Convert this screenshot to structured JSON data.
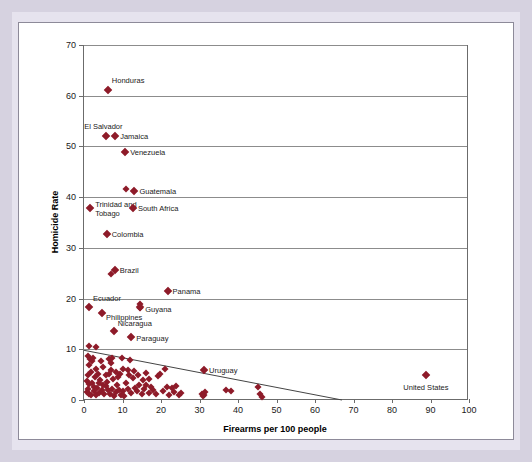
{
  "figure": {
    "background_color": "#d6d2e0",
    "card_color": "#ffffff",
    "marker_color": "#8e1b29"
  },
  "chart_data": {
    "type": "scatter",
    "title": "",
    "subtitle": "",
    "xlabel": "Firearms per 100 people",
    "ylabel": "Homicide Rate",
    "xlim": [
      0,
      100
    ],
    "ylim": [
      0,
      70
    ],
    "xticks": [
      0,
      10,
      20,
      30,
      40,
      50,
      60,
      70,
      80,
      90,
      100
    ],
    "yticks": [
      0,
      10,
      20,
      30,
      40,
      50,
      60,
      70
    ],
    "grid": "horizontal",
    "legend": "none",
    "marker": "diamond",
    "marker_color": "#8e1b29",
    "trendline": {
      "visible": true,
      "color": "#444444",
      "x_start": 0,
      "y_start": 9.8,
      "x_end": 67,
      "y_end": 0
    },
    "annotations": [
      {
        "label": "Honduras",
        "x": 6.2,
        "y": 61.2,
        "label_dx": 4,
        "label_dy": -9,
        "align": "left"
      },
      {
        "label": "El Salvador",
        "x": 5.8,
        "y": 52.0,
        "label_dx": -3,
        "label_dy": -9,
        "align": "right_of_left"
      },
      {
        "label": "Jamaica",
        "x": 8.1,
        "y": 52.0,
        "label_dx": 5,
        "label_dy": 1,
        "align": "left"
      },
      {
        "label": "Venezuela",
        "x": 10.7,
        "y": 49.0,
        "label_dx": 5,
        "label_dy": 1,
        "align": "left"
      },
      {
        "label": "Guatemala",
        "x": 13.1,
        "y": 41.3,
        "label_dx": 5,
        "label_dy": 1,
        "align": "left"
      },
      {
        "label": "Trinidad and\nTobago",
        "x": 1.6,
        "y": 37.8,
        "label_dx": 5,
        "label_dy": 2,
        "align": "left"
      },
      {
        "label": "South Africa",
        "x": 12.7,
        "y": 37.8,
        "label_dx": 5,
        "label_dy": 1,
        "align": "left"
      },
      {
        "label": "Colombia",
        "x": 5.9,
        "y": 32.7,
        "label_dx": 5,
        "label_dy": 1,
        "align": "left"
      },
      {
        "label": "Brazil",
        "x": 8.0,
        "y": 25.6,
        "label_dx": 5,
        "label_dy": 1,
        "align": "left"
      },
      {
        "label": "Panama",
        "x": 21.7,
        "y": 21.4,
        "label_dx": 5,
        "label_dy": 1,
        "align": "left"
      },
      {
        "label": "Ecuador",
        "x": 1.3,
        "y": 18.3,
        "label_dx": 4,
        "label_dy": -8,
        "align": "left"
      },
      {
        "label": "Guyana",
        "x": 14.6,
        "y": 18.4,
        "label_dx": 5,
        "label_dy": 3,
        "align": "left"
      },
      {
        "label": "Philippines",
        "x": 4.7,
        "y": 17.2,
        "label_dx": 4,
        "label_dy": 5,
        "align": "left"
      },
      {
        "label": "Nicaragua",
        "x": 7.7,
        "y": 13.6,
        "label_dx": 4,
        "label_dy": -7,
        "align": "left"
      },
      {
        "label": "Paraguay",
        "x": 12.3,
        "y": 12.5,
        "label_dx": 5,
        "label_dy": 2,
        "align": "left"
      },
      {
        "label": "Uruguay",
        "x": 31.2,
        "y": 6.0,
        "label_dx": 5,
        "label_dy": 1,
        "align": "left"
      },
      {
        "label": "United States",
        "x": 88.8,
        "y": 5.0,
        "label_dx": 0,
        "label_dy": 9,
        "align": "center"
      }
    ],
    "points": [
      [
        6.2,
        61.2
      ],
      [
        5.8,
        52.0
      ],
      [
        8.1,
        52.0
      ],
      [
        10.7,
        49.0
      ],
      [
        11.0,
        41.7
      ],
      [
        13.1,
        41.3
      ],
      [
        1.6,
        37.8
      ],
      [
        12.7,
        37.8
      ],
      [
        5.9,
        32.7
      ],
      [
        7.0,
        24.9
      ],
      [
        8.0,
        25.6
      ],
      [
        21.7,
        21.4
      ],
      [
        1.3,
        18.3
      ],
      [
        14.5,
        18.9
      ],
      [
        14.6,
        18.1
      ],
      [
        4.7,
        17.2
      ],
      [
        7.7,
        13.6
      ],
      [
        12.3,
        12.5
      ],
      [
        1.4,
        10.6
      ],
      [
        3.1,
        10.5
      ],
      [
        1.0,
        8.6
      ],
      [
        1.5,
        8.0
      ],
      [
        2.0,
        7.6
      ],
      [
        2.4,
        8.2
      ],
      [
        1.2,
        7.0
      ],
      [
        4.4,
        7.6
      ],
      [
        5.0,
        6.6
      ],
      [
        6.4,
        8.0
      ],
      [
        7.0,
        7.3
      ],
      [
        7.2,
        8.3
      ],
      [
        9.9,
        8.2
      ],
      [
        10.2,
        6.2
      ],
      [
        6.9,
        6.0
      ],
      [
        6.6,
        5.2
      ],
      [
        5.6,
        5.0
      ],
      [
        3.2,
        6.1
      ],
      [
        3.6,
        5.2
      ],
      [
        2.8,
        4.6
      ],
      [
        1.8,
        5.5
      ],
      [
        1.1,
        4.9
      ],
      [
        0.8,
        3.8
      ],
      [
        1.4,
        3.2
      ],
      [
        2.1,
        3.4
      ],
      [
        2.6,
        2.6
      ],
      [
        1.0,
        2.2
      ],
      [
        0.7,
        1.6
      ],
      [
        1.3,
        1.2
      ],
      [
        1.9,
        1.0
      ],
      [
        2.5,
        1.7
      ],
      [
        3.0,
        0.9
      ],
      [
        3.5,
        2.4
      ],
      [
        4.0,
        1.4
      ],
      [
        4.6,
        2.0
      ],
      [
        5.2,
        1.1
      ],
      [
        5.8,
        2.8
      ],
      [
        6.2,
        1.9
      ],
      [
        6.8,
        1.2
      ],
      [
        7.3,
        2.2
      ],
      [
        7.8,
        0.8
      ],
      [
        8.2,
        1.6
      ],
      [
        8.7,
        3.0
      ],
      [
        9.1,
        2.0
      ],
      [
        9.6,
        1.0
      ],
      [
        10.0,
        1.8
      ],
      [
        10.5,
        0.7
      ],
      [
        8.9,
        4.6
      ],
      [
        9.3,
        5.1
      ],
      [
        8.4,
        5.6
      ],
      [
        7.6,
        4.2
      ],
      [
        6.0,
        3.6
      ],
      [
        5.0,
        3.0
      ],
      [
        4.2,
        4.0
      ],
      [
        3.8,
        3.3
      ],
      [
        12.0,
        7.9
      ],
      [
        11.3,
        5.9
      ],
      [
        11.8,
        5.0
      ],
      [
        12.6,
        4.4
      ],
      [
        13.2,
        2.4
      ],
      [
        13.8,
        1.7
      ],
      [
        14.4,
        2.9
      ],
      [
        15.0,
        1.1
      ],
      [
        15.6,
        2.1
      ],
      [
        16.2,
        3.0
      ],
      [
        16.8,
        1.4
      ],
      [
        17.4,
        2.5
      ],
      [
        18.0,
        2.0
      ],
      [
        18.6,
        1.2
      ],
      [
        19.2,
        4.8
      ],
      [
        19.8,
        5.2
      ],
      [
        20.4,
        1.8
      ],
      [
        21.0,
        6.1
      ],
      [
        21.6,
        2.6
      ],
      [
        22.2,
        1.0
      ],
      [
        22.8,
        2.3
      ],
      [
        23.4,
        1.5
      ],
      [
        24.0,
        2.8
      ],
      [
        24.6,
        0.9
      ],
      [
        25.2,
        1.3
      ],
      [
        13.0,
        5.8
      ],
      [
        14.0,
        4.9
      ],
      [
        15.2,
        4.0
      ],
      [
        16.0,
        5.4
      ],
      [
        17.0,
        4.2
      ],
      [
        10.8,
        3.4
      ],
      [
        11.5,
        2.2
      ],
      [
        12.2,
        1.3
      ],
      [
        30.6,
        1.2
      ],
      [
        31.2,
        1.0
      ],
      [
        31.5,
        1.6
      ],
      [
        31.0,
        0.8
      ],
      [
        36.8,
        1.9
      ],
      [
        38.2,
        1.7
      ],
      [
        31.2,
        6.0
      ],
      [
        45.3,
        2.6
      ],
      [
        45.8,
        1.2
      ],
      [
        46.2,
        0.6
      ],
      [
        88.8,
        5.0
      ]
    ]
  }
}
